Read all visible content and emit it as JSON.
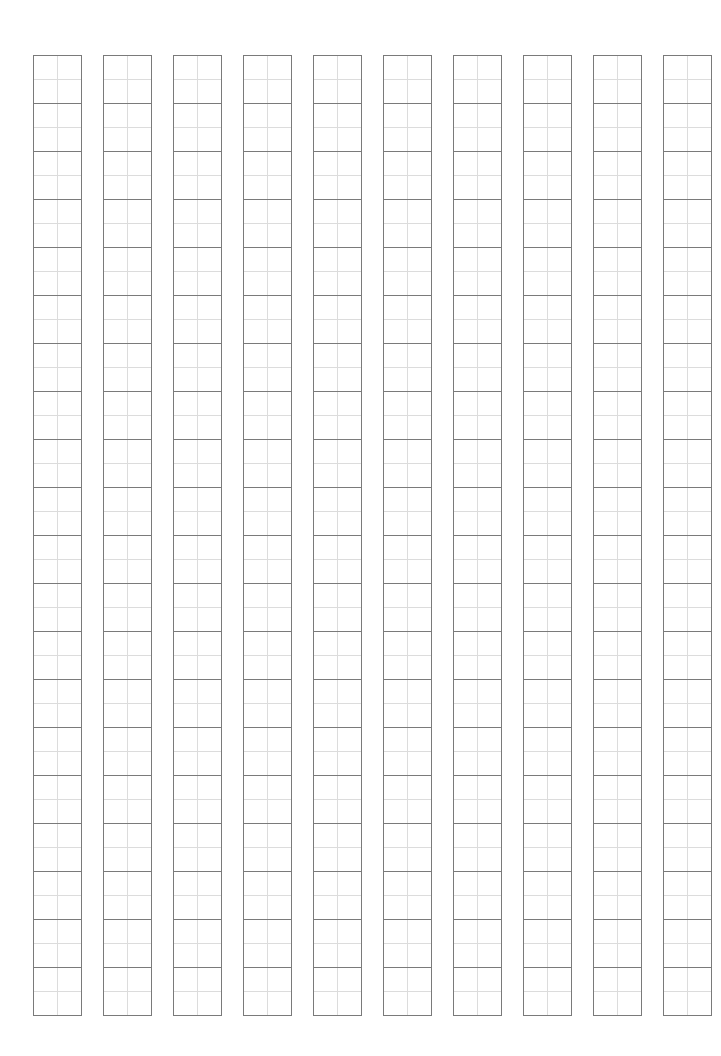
{
  "sheet": {
    "type": "tianzige-practice-grid",
    "columns": 10,
    "rows": 20,
    "cell_size_px": 48,
    "column_pitch_px": 70,
    "origin": {
      "x": 33,
      "y": 55
    },
    "colors": {
      "background": "#ffffff",
      "cell_border": "#7a7a7a",
      "guide_cross": "#dcdcdc"
    },
    "cells_filled": []
  }
}
